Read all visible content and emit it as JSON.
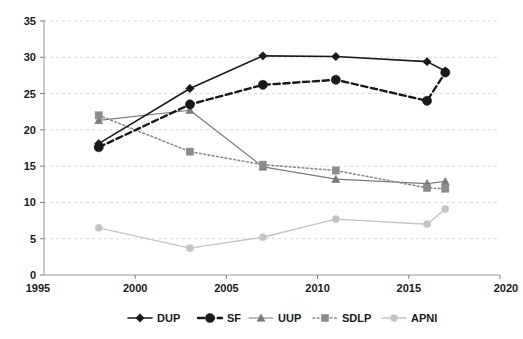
{
  "chart_data": {
    "type": "line",
    "title": "",
    "subtitle": "",
    "xlabel": "",
    "ylabel": "",
    "x": [
      1998,
      2003,
      2007,
      2011,
      2016,
      2017
    ],
    "categories": [
      "1998",
      "2003",
      "2007",
      "2011",
      "2016",
      "2017"
    ],
    "xlim": [
      1995,
      2020
    ],
    "ylim": [
      0,
      35
    ],
    "x_ticks": [
      1995,
      2000,
      2005,
      2010,
      2015,
      2020
    ],
    "x_tick_labels": [
      "1995",
      "2000",
      "2005",
      "2010",
      "2015",
      "2020"
    ],
    "y_ticks": [
      0,
      5,
      10,
      15,
      20,
      25,
      30,
      35
    ],
    "y_tick_labels": [
      "0",
      "5",
      "10",
      "15",
      "20",
      "25",
      "30",
      "35"
    ],
    "grid": "horizontal-dashed",
    "legend_position": "bottom",
    "series": [
      {
        "name": "DUP",
        "values": [
          18.1,
          25.7,
          30.2,
          30.1,
          29.4,
          28.1
        ],
        "color": "#1a1a1a",
        "line_style": "solid",
        "marker": "diamond",
        "line_width": 1.6,
        "marker_size": 4.2
      },
      {
        "name": "SF",
        "values": [
          17.6,
          23.5,
          26.2,
          26.9,
          24.0,
          27.9
        ],
        "color": "#1a1a1a",
        "line_style": "dashed",
        "marker": "circle",
        "line_width": 2.4,
        "marker_size": 4.6
      },
      {
        "name": "UUP",
        "values": [
          21.3,
          22.7,
          14.9,
          13.2,
          12.6,
          12.9
        ],
        "color": "#7a7a7a",
        "line_style": "solid",
        "marker": "triangle",
        "line_width": 1.2,
        "marker_size": 4.0
      },
      {
        "name": "SDLP",
        "values": [
          22.0,
          17.0,
          15.2,
          14.4,
          12.0,
          11.9
        ],
        "color": "#8c8c8c",
        "line_style": "dotted",
        "marker": "square",
        "line_width": 1.6,
        "marker_size": 3.6
      },
      {
        "name": "APNI",
        "values": [
          6.5,
          3.7,
          5.2,
          7.7,
          7.0,
          9.1
        ],
        "color": "#c4c4c4",
        "line_style": "solid",
        "marker": "circle",
        "line_width": 1.4,
        "marker_size": 3.6
      }
    ]
  },
  "legend": {
    "entries": [
      {
        "label": "DUP"
      },
      {
        "label": "SF"
      },
      {
        "label": "UUP"
      },
      {
        "label": "SDLP"
      },
      {
        "label": "APNI"
      }
    ]
  }
}
